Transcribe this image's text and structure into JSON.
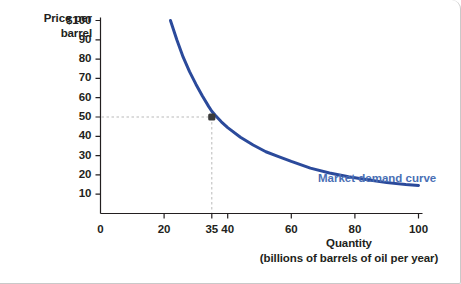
{
  "figure": {
    "background_color": "#ffffff",
    "border_color": "#c9c9c9"
  },
  "axes": {
    "y_axis_title_line1": "Price per",
    "y_axis_title_line2": "barrel",
    "x_axis_title_line1": "Quantity",
    "x_axis_title_line2": "(billions of barrels of oil per year)",
    "axis_color": "#231f20"
  },
  "annotation": {
    "label": "Market demand curve",
    "color": "#4a6fb5"
  },
  "chart_data": {
    "type": "line",
    "title": "",
    "subtitle": "",
    "xlabel": "Quantity (billions of barrels of oil per year)",
    "ylabel": "Price per barrel",
    "xlim": [
      0,
      105
    ],
    "ylim": [
      0,
      100
    ],
    "grid": false,
    "legend_position": "inline-right",
    "curve_color": "#2b4a9b",
    "curve_width": 3,
    "x_ticks": [
      0,
      20,
      35,
      40,
      60,
      80,
      100
    ],
    "x_tick_labels": [
      "0",
      "20",
      "35",
      "40",
      "60",
      "80",
      "100"
    ],
    "y_ticks": [
      10,
      20,
      30,
      40,
      50,
      60,
      70,
      80,
      90,
      100
    ],
    "y_tick_labels": [
      "10",
      "20",
      "30",
      "40",
      "50",
      "60",
      "70",
      "80",
      "90",
      "$100"
    ],
    "series": [
      {
        "name": "Market demand curve",
        "x": [
          22,
          24,
          26,
          28,
          30,
          32,
          34,
          35,
          36,
          38,
          40,
          44,
          48,
          52,
          56,
          60,
          66,
          72,
          78,
          84,
          90,
          96,
          100
        ],
        "y": [
          100,
          90,
          81,
          73.5,
          67,
          61,
          55.5,
          53,
          51,
          47.5,
          44.5,
          39.5,
          35.5,
          32,
          29.5,
          27,
          23.5,
          21,
          19,
          17.5,
          16,
          15,
          14.5
        ]
      }
    ],
    "highlight_point": {
      "x": 35,
      "y": 50,
      "color": "#3b3b3b",
      "guide_line_color": "#b9b9b9",
      "guide_line_style": "dashed"
    }
  }
}
